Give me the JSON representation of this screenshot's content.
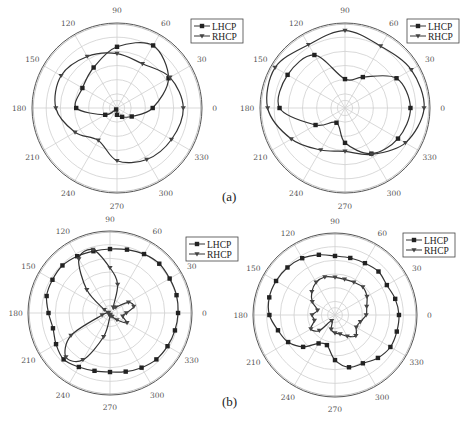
{
  "figure": {
    "captions": [
      {
        "label": "(a)",
        "x": 222,
        "y": 200
      },
      {
        "label": "(b)",
        "x": 222,
        "y": 405
      }
    ],
    "legend_entries": [
      "LHCP",
      "RHCP"
    ],
    "colors": {
      "line": "#333333",
      "grid": "#cfcfcf",
      "outer": "#555555",
      "text": "#555555"
    }
  },
  "chart_data": [
    {
      "type": "polar-line",
      "panel": "(a) left",
      "center": [
        117,
        108
      ],
      "radius": 85,
      "angular_ticks": [
        0,
        30,
        60,
        90,
        120,
        150,
        180,
        210,
        240,
        270,
        300,
        330
      ],
      "radial_rings": 5,
      "legend": {
        "entries": [
          "LHCP",
          "RHCP"
        ],
        "x": 191,
        "y": 19
      },
      "series": [
        {
          "name": "LHCP",
          "marker": "square",
          "theta": [
            0,
            30,
            60,
            90,
            120,
            150,
            180,
            210,
            240,
            270,
            300,
            330
          ],
          "r": [
            0.42,
            0.7,
            0.85,
            0.72,
            0.55,
            0.47,
            0.48,
            0.16,
            0.02,
            0.08,
            0.12,
            0.2
          ]
        },
        {
          "name": "RHCP",
          "marker": "triangle-down",
          "theta": [
            0,
            30,
            60,
            90,
            120,
            150,
            180,
            210,
            240,
            270,
            300,
            330
          ],
          "r": [
            0.78,
            0.72,
            0.6,
            0.64,
            0.7,
            0.76,
            0.72,
            0.57,
            0.44,
            0.62,
            0.7,
            0.74
          ]
        }
      ]
    },
    {
      "type": "polar-line",
      "panel": "(a) right",
      "center": [
        345,
        108
      ],
      "radius": 85,
      "angular_ticks": [
        0,
        30,
        60,
        90,
        120,
        150,
        180,
        210,
        240,
        270,
        300,
        330
      ],
      "radial_rings": 5,
      "legend": {
        "entries": [
          "LHCP",
          "RHCP"
        ],
        "x": 407,
        "y": 19
      },
      "series": [
        {
          "name": "LHCP",
          "marker": "square",
          "theta": [
            0,
            30,
            60,
            90,
            120,
            150,
            180,
            210,
            240,
            270,
            300,
            330
          ],
          "r": [
            0.77,
            0.7,
            0.42,
            0.34,
            0.72,
            0.78,
            0.77,
            0.4,
            0.2,
            0.41,
            0.62,
            0.72
          ]
        },
        {
          "name": "RHCP",
          "marker": "triangle-down",
          "theta": [
            0,
            30,
            60,
            90,
            120,
            150,
            180,
            210,
            240,
            270,
            300,
            330
          ],
          "r": [
            0.93,
            0.9,
            0.84,
            0.91,
            0.86,
            0.95,
            0.91,
            0.73,
            0.57,
            0.51,
            0.63,
            0.82
          ]
        }
      ]
    },
    {
      "type": "polar-line",
      "panel": "(b) left",
      "center": [
        110,
        313
      ],
      "radius": 82,
      "angular_ticks": [
        0,
        30,
        60,
        90,
        120,
        150,
        180,
        210,
        240,
        270,
        300,
        330
      ],
      "radial_rings": 5,
      "legend": {
        "entries": [
          "LHCP",
          "RHCP"
        ],
        "x": 186,
        "y": 237
      },
      "series": [
        {
          "name": "LHCP",
          "marker": "square",
          "theta": [
            0,
            15,
            30,
            45,
            60,
            75,
            90,
            105,
            120,
            135,
            150,
            165,
            180,
            195,
            210,
            225,
            240,
            255,
            270,
            285,
            300,
            315,
            330,
            345
          ],
          "r": [
            0.83,
            0.84,
            0.84,
            0.85,
            0.83,
            0.8,
            0.78,
            0.78,
            0.8,
            0.82,
            0.81,
            0.8,
            0.75,
            0.72,
            0.76,
            0.8,
            0.76,
            0.73,
            0.72,
            0.74,
            0.77,
            0.8,
            0.81,
            0.82
          ]
        },
        {
          "name": "RHCP",
          "marker": "triangle-down",
          "theta": [
            0,
            15,
            30,
            45,
            60,
            75,
            90,
            105,
            120,
            135,
            150,
            165,
            180,
            195,
            210,
            225,
            240,
            255,
            270,
            285,
            300,
            315,
            330,
            345
          ],
          "r": [
            0.2,
            0.3,
            0.26,
            0.1,
            0.08,
            0.36,
            0.55,
            0.8,
            0.76,
            0.4,
            0.08,
            0.02,
            0.02,
            0.1,
            0.55,
            0.76,
            0.66,
            0.3,
            0.04,
            0.02,
            0.05,
            0.12,
            0.24,
            0.16
          ]
        }
      ]
    },
    {
      "type": "polar-line",
      "panel": "(b) right",
      "center": [
        335,
        315
      ],
      "radius": 82,
      "angular_ticks": [
        0,
        30,
        60,
        90,
        120,
        150,
        180,
        210,
        240,
        270,
        300,
        330
      ],
      "radial_rings": 5,
      "legend": {
        "entries": [
          "LHCP",
          "RHCP"
        ],
        "x": 403,
        "y": 233
      },
      "series": [
        {
          "name": "LHCP",
          "marker": "square",
          "theta": [
            0,
            15,
            30,
            45,
            60,
            75,
            90,
            105,
            120,
            135,
            150,
            165,
            180,
            195,
            210,
            225,
            240,
            255,
            270,
            285,
            300,
            315,
            330,
            345
          ],
          "r": [
            0.78,
            0.76,
            0.73,
            0.75,
            0.73,
            0.72,
            0.72,
            0.76,
            0.8,
            0.82,
            0.83,
            0.83,
            0.8,
            0.72,
            0.66,
            0.55,
            0.4,
            0.38,
            0.55,
            0.66,
            0.68,
            0.74,
            0.78,
            0.78
          ]
        },
        {
          "name": "RHCP",
          "marker": "triangle-down",
          "theta": [
            0,
            15,
            30,
            45,
            60,
            75,
            90,
            105,
            120,
            135,
            150,
            165,
            180,
            195,
            210,
            225,
            240,
            255,
            270,
            285,
            300,
            315,
            330,
            345
          ],
          "r": [
            0.38,
            0.4,
            0.45,
            0.48,
            0.46,
            0.45,
            0.46,
            0.48,
            0.46,
            0.4,
            0.32,
            0.22,
            0.28,
            0.26,
            0.34,
            0.27,
            0.08,
            0.18,
            0.22,
            0.24,
            0.3,
            0.36,
            0.3,
            0.32
          ]
        }
      ]
    }
  ]
}
